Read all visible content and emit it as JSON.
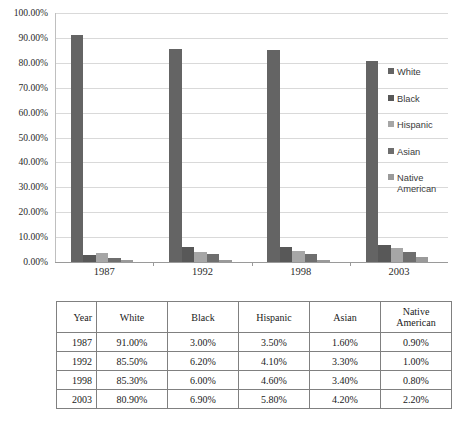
{
  "chart_data": {
    "type": "bar",
    "title": "",
    "xlabel": "",
    "ylabel": "",
    "ylim": [
      0,
      100
    ],
    "ytick_format": "percent",
    "grid": true,
    "legend_position": "right",
    "categories": [
      "1987",
      "1992",
      "1998",
      "2003"
    ],
    "ytick_labels": [
      "100.00%",
      "90.00%",
      "80.00%",
      "70.00%",
      "60.00%",
      "50.00%",
      "40.00%",
      "30.00%",
      "20.00%",
      "10.00%",
      "0.00%"
    ],
    "ytick_values": [
      100,
      90,
      80,
      70,
      60,
      50,
      40,
      30,
      20,
      10,
      0
    ],
    "series": [
      {
        "name": "White",
        "color": "#646464",
        "values": [
          91.0,
          85.5,
          85.3,
          80.9
        ]
      },
      {
        "name": "Black",
        "color": "#585858",
        "values": [
          3.0,
          6.2,
          6.0,
          6.9
        ]
      },
      {
        "name": "Hispanic",
        "color": "#a6a6a6",
        "values": [
          3.5,
          4.1,
          4.6,
          5.8
        ]
      },
      {
        "name": "Asian",
        "color": "#6e6e6e",
        "values": [
          1.6,
          3.3,
          3.4,
          4.2
        ]
      },
      {
        "name": "Native American",
        "color": "#9a9a9a",
        "values": [
          0.9,
          1.0,
          0.8,
          2.2
        ]
      }
    ],
    "legend": [
      {
        "label": "White",
        "label2": "",
        "color": "#646464"
      },
      {
        "label": "Black",
        "label2": "",
        "color": "#585858"
      },
      {
        "label": "Hispanic",
        "label2": "",
        "color": "#a6a6a6"
      },
      {
        "label": "Asian",
        "label2": "",
        "color": "#6e6e6e"
      },
      {
        "label": "Native",
        "label2": "American",
        "color": "#9a9a9a"
      }
    ]
  },
  "table": {
    "columns": [
      "Year",
      "White",
      "Black",
      "Hispanic",
      "Asian",
      "Native American"
    ],
    "column_header_lines": [
      [
        "Year"
      ],
      [
        "White"
      ],
      [
        "Black"
      ],
      [
        "Hispanic"
      ],
      [
        "Asian"
      ],
      [
        "Native",
        "American"
      ]
    ],
    "rows": [
      {
        "year": "1987",
        "white": "91.00%",
        "black": "3.00%",
        "hispanic": "3.50%",
        "asian": "1.60%",
        "native_american": "0.90%"
      },
      {
        "year": "1992",
        "white": "85.50%",
        "black": "6.20%",
        "hispanic": "4.10%",
        "asian": "3.30%",
        "native_american": "1.00%"
      },
      {
        "year": "1998",
        "white": "85.30%",
        "black": "6.00%",
        "hispanic": "4.60%",
        "asian": "3.40%",
        "native_american": "0.80%"
      },
      {
        "year": "2003",
        "white": "80.90%",
        "black": "6.90%",
        "hispanic": "5.80%",
        "asian": "4.20%",
        "native_american": "2.20%"
      }
    ]
  },
  "colors": {
    "gridline": "#d9d9d9",
    "axis": "#9a9a9a",
    "table_border": "#808080",
    "text": "#231f20",
    "background": "#ffffff"
  }
}
